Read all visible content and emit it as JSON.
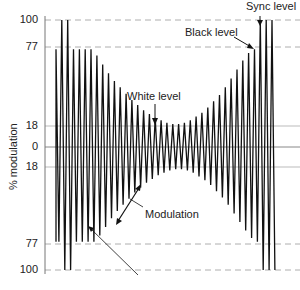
{
  "chart_data": {
    "type": "line",
    "title": "",
    "xlabel": "",
    "ylabel": "% modulation",
    "ylim": [
      -100,
      100
    ],
    "ytick_labels": [
      "100",
      "77",
      "18",
      "0",
      "18",
      "77",
      "100"
    ],
    "ytick_values": [
      100,
      77,
      18,
      0,
      -18,
      -77,
      -100
    ],
    "reference_lines": [
      {
        "value": 100,
        "style": "dashed"
      },
      {
        "value": 77,
        "style": "dashed"
      },
      {
        "value": 18,
        "style": "solid-light"
      },
      {
        "value": 0,
        "style": "solid"
      },
      {
        "value": -18,
        "style": "solid-light"
      },
      {
        "value": -77,
        "style": "dashed"
      },
      {
        "value": -100,
        "style": "dashed"
      }
    ],
    "series": [
      {
        "name": "Modulated carrier",
        "envelope_peaks": [
          77,
          100,
          100,
          77,
          77,
          77,
          77,
          72,
          65,
          58,
          52,
          47,
          42,
          37,
          33,
          29,
          26,
          23,
          21,
          19,
          18,
          18,
          19,
          21,
          24,
          27,
          31,
          36,
          41,
          47,
          54,
          61,
          68,
          74,
          77,
          100,
          100,
          100
        ]
      }
    ],
    "annotations": [
      {
        "text": "Sync level",
        "target": 100
      },
      {
        "text": "Black level",
        "target": 77
      },
      {
        "text": "White level",
        "target": 18
      },
      {
        "text": "Modulation",
        "type": "double-arrow"
      }
    ]
  },
  "labels": {
    "ylabel": "% modulation",
    "sync": "Sync level",
    "black": "Black level",
    "white": "White level",
    "modulation": "Modulation"
  },
  "ticks": {
    "t100": "100",
    "t77": "77",
    "t18": "18",
    "t0": "0",
    "tn18": "18",
    "tn77": "77",
    "tn100": "100"
  }
}
